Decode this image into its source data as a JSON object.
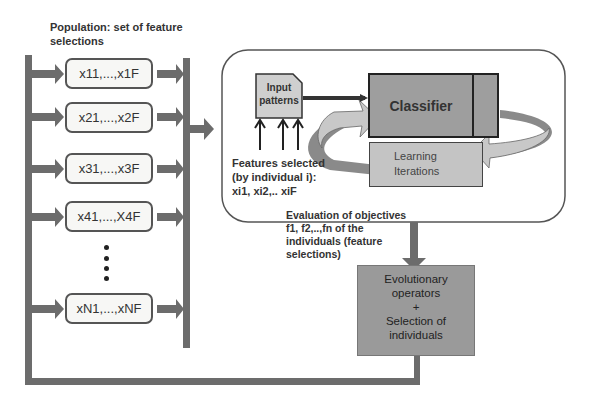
{
  "population": {
    "title_line1": "Population: set of feature",
    "title_line2": "selections",
    "individuals": [
      "x11,...,x1F",
      "x21,...,x2F",
      "x31,...,x3F",
      "x41,...,X4F",
      "xN1,...,xNF"
    ],
    "ellipsis_dots": 4
  },
  "evaluation_block": {
    "input_patterns_line1": "Input",
    "input_patterns_line2": "patterns",
    "classifier_label": "Classifier",
    "learning_line1": "Learning",
    "learning_line2": "Iterations",
    "features_line1": "Features selected",
    "features_line2": "(by individual i):",
    "features_line3": "xi1, xi2,.. xiF"
  },
  "objectives_caption": {
    "line1": "Evaluation of objectives",
    "line2": "f1, f2,..,fn of the",
    "line3": "individuals (feature",
    "line4": "selections)"
  },
  "evolution_box": {
    "line1": "Evolutionary",
    "line2": "operators",
    "line3": "+",
    "line4": "Selection of",
    "line5": "individuals"
  },
  "colors": {
    "bar": "#6c6c6c",
    "classifier_fill": "#9e9e9e",
    "learning_fill": "#c4c4c4",
    "input_fill": "#cfcfcf",
    "evolution_fill": "#9a9a9a",
    "loop_arrow_light": "#c8c8c8",
    "loop_arrow_dark": "#8a8a8a"
  }
}
